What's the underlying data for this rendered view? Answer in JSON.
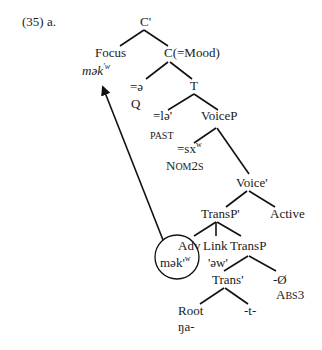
{
  "example_label": "(35) a.",
  "nodes": {
    "c_bar": "C'",
    "focus": "Focus",
    "focus_form": "mək",
    "focus_form_sup": "'w",
    "c_mood": "C(=Mood)",
    "q_form": "=ə",
    "q_gloss": "Q",
    "t": "T",
    "past_form": "=lə'",
    "past_gloss": "PAST",
    "voicep": "VoiceP",
    "nom_form": "=sx",
    "nom_form_sup": "w",
    "nom_gloss": "NOM2S",
    "voice_bar": "Voice'",
    "transp_bar": "TransP'",
    "active": "Active",
    "adv": "Adv",
    "adv_form": "mək'",
    "adv_form_sup": "w",
    "link": "Link",
    "link_form": "'əw'",
    "transp": "TransP",
    "trans_bar": "Trans'",
    "abs_form": "-Ø",
    "abs_gloss": "ABS3",
    "root": "Root",
    "root_form": "ŋa-",
    "t_suffix": "-t-"
  },
  "movement_arrow": {
    "from": "adv",
    "to": "focus"
  }
}
